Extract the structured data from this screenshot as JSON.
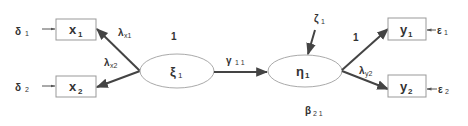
{
  "diagram": {
    "type": "structural-equation-model",
    "colors": {
      "box_stroke": "#999999",
      "ellipse_stroke": "#aaaaaa",
      "arrow": "#444444",
      "text": "#333333"
    },
    "observed_exogenous": [
      {
        "id": "x1",
        "label": "x",
        "sub": "1",
        "error": {
          "label": "δ",
          "sub": "1"
        }
      },
      {
        "id": "x2",
        "label": "x",
        "sub": "2",
        "error": {
          "label": "δ",
          "sub": "2"
        }
      }
    ],
    "observed_endogenous": [
      {
        "id": "y1",
        "label": "y",
        "sub": "1",
        "error": {
          "label": "ε",
          "sub": "1"
        }
      },
      {
        "id": "y2",
        "label": "y",
        "sub": "2",
        "error": {
          "label": "ε",
          "sub": "2"
        }
      }
    ],
    "latent": [
      {
        "id": "xi1",
        "label": "ξ",
        "sub": "1",
        "fixed_label": "1"
      },
      {
        "id": "eta1",
        "label": "η",
        "sub": "1",
        "disturbance": {
          "label": "ζ",
          "sub": "1"
        }
      }
    ],
    "paths": [
      {
        "from": "xi1",
        "to": "x1",
        "label": "λ",
        "sub": "x1"
      },
      {
        "from": "xi1",
        "to": "x2",
        "label": "λ",
        "sub": "x2"
      },
      {
        "from": "xi1",
        "to": "eta1",
        "label": "γ",
        "sub": "1 1"
      },
      {
        "from": "eta1",
        "to": "y1",
        "label": "1",
        "sub": ""
      },
      {
        "from": "eta1",
        "to": "y2",
        "label": "λ",
        "sub": "y2"
      }
    ],
    "beta_label": {
      "label": "β",
      "sub": "2 1"
    }
  }
}
